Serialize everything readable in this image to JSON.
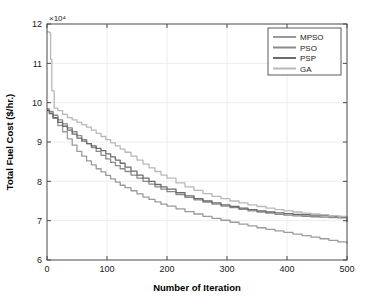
{
  "chart_data": {
    "type": "line",
    "title": "",
    "xlabel": "Number of Iteration",
    "ylabel": "Total Fuel Cost ($/hr.)",
    "y_exponent_label": "×10⁴",
    "y_exponent_value": 10000,
    "xlim": [
      0,
      500
    ],
    "ylim": [
      6,
      12
    ],
    "xticks": [
      0,
      100,
      200,
      300,
      400,
      500
    ],
    "yticks": [
      6,
      7,
      8,
      9,
      10,
      11,
      12
    ],
    "xtick_labels": [
      "0",
      "100",
      "200",
      "300",
      "400",
      "500"
    ],
    "ytick_labels": [
      "6",
      "7",
      "8",
      "9",
      "10",
      "11",
      "12"
    ],
    "grid": true,
    "legend_position": "top-right",
    "colors": {
      "MPSO": "#9a9a9a",
      "PSO": "#8a8a8a",
      "PSP": "#6b6b6b",
      "GA": "#b8b8b8"
    },
    "series": [
      {
        "name": "MPSO",
        "color": "#9a9a9a",
        "x": [
          0,
          4,
          10,
          18,
          26,
          34,
          42,
          50,
          58,
          66,
          74,
          82,
          90,
          98,
          106,
          114,
          122,
          130,
          140,
          150,
          160,
          170,
          180,
          190,
          200,
          215,
          230,
          245,
          260,
          275,
          290,
          305,
          320,
          335,
          350,
          365,
          380,
          395,
          410,
          425,
          440,
          455,
          470,
          485,
          500
        ],
        "y": [
          9.82,
          9.74,
          9.6,
          9.42,
          9.26,
          9.08,
          8.92,
          8.76,
          8.64,
          8.52,
          8.42,
          8.32,
          8.24,
          8.15,
          8.06,
          7.98,
          7.9,
          7.84,
          7.76,
          7.68,
          7.6,
          7.54,
          7.48,
          7.42,
          7.37,
          7.3,
          7.23,
          7.17,
          7.11,
          7.06,
          7.01,
          6.96,
          6.91,
          6.87,
          6.82,
          6.78,
          6.74,
          6.7,
          6.66,
          6.62,
          6.58,
          6.54,
          6.5,
          6.46,
          6.42
        ]
      },
      {
        "name": "PSO",
        "color": "#8a8a8a",
        "x": [
          0,
          4,
          10,
          18,
          26,
          34,
          42,
          50,
          58,
          66,
          74,
          82,
          90,
          98,
          106,
          114,
          122,
          130,
          140,
          150,
          160,
          170,
          180,
          190,
          200,
          215,
          230,
          245,
          260,
          275,
          290,
          305,
          320,
          335,
          350,
          365,
          380,
          395,
          410,
          425,
          440,
          455,
          470,
          485,
          500
        ],
        "y": [
          9.84,
          9.78,
          9.68,
          9.56,
          9.46,
          9.36,
          9.26,
          9.16,
          9.06,
          8.96,
          8.86,
          8.76,
          8.66,
          8.57,
          8.48,
          8.4,
          8.32,
          8.25,
          8.16,
          8.08,
          8.0,
          7.93,
          7.86,
          7.8,
          7.74,
          7.66,
          7.59,
          7.53,
          7.47,
          7.42,
          7.37,
          7.33,
          7.29,
          7.25,
          7.22,
          7.19,
          7.16,
          7.14,
          7.12,
          7.11,
          7.1,
          7.09,
          7.08,
          7.07,
          7.06
        ]
      },
      {
        "name": "PSP",
        "color": "#6b6b6b",
        "x": [
          0,
          4,
          10,
          18,
          26,
          34,
          42,
          50,
          58,
          66,
          74,
          82,
          90,
          98,
          106,
          114,
          122,
          130,
          140,
          150,
          160,
          170,
          180,
          190,
          200,
          215,
          230,
          245,
          260,
          275,
          290,
          305,
          320,
          335,
          350,
          365,
          380,
          395,
          410,
          425,
          440,
          455,
          470,
          480,
          490,
          500
        ],
        "y": [
          9.8,
          9.72,
          9.62,
          9.5,
          9.4,
          9.3,
          9.2,
          9.1,
          9.02,
          8.96,
          8.9,
          8.84,
          8.78,
          8.7,
          8.62,
          8.54,
          8.46,
          8.36,
          8.26,
          8.16,
          8.08,
          8.0,
          7.92,
          7.86,
          7.8,
          7.71,
          7.63,
          7.56,
          7.5,
          7.45,
          7.4,
          7.36,
          7.32,
          7.28,
          7.25,
          7.22,
          7.2,
          7.18,
          7.16,
          7.15,
          7.14,
          7.13,
          7.12,
          7.11,
          7.1,
          6.96
        ]
      },
      {
        "name": "GA",
        "color": "#b8b8b8",
        "x": [
          0,
          2,
          4,
          6,
          8,
          12,
          18,
          26,
          34,
          42,
          50,
          58,
          66,
          74,
          82,
          90,
          98,
          106,
          114,
          122,
          130,
          140,
          150,
          160,
          170,
          180,
          190,
          200,
          215,
          230,
          245,
          260,
          275,
          290,
          305,
          320,
          335,
          350,
          365,
          380,
          395,
          410,
          425,
          440,
          455,
          470,
          485,
          500
        ],
        "y": [
          11.8,
          11.8,
          11.78,
          11.1,
          10.3,
          9.86,
          9.8,
          9.7,
          9.62,
          9.56,
          9.5,
          9.44,
          9.38,
          9.3,
          9.22,
          9.14,
          9.06,
          8.98,
          8.9,
          8.82,
          8.74,
          8.64,
          8.54,
          8.44,
          8.34,
          8.25,
          8.16,
          8.08,
          7.96,
          7.86,
          7.77,
          7.69,
          7.62,
          7.56,
          7.5,
          7.45,
          7.4,
          7.36,
          7.32,
          7.28,
          7.25,
          7.22,
          7.19,
          7.17,
          7.15,
          7.13,
          7.11,
          7.09
        ]
      }
    ],
    "legend_entries": [
      "MPSO",
      "PSO",
      "PSP",
      "GA"
    ]
  },
  "legend": {
    "items": [
      {
        "label": "MPSO"
      },
      {
        "label": "PSO"
      },
      {
        "label": "PSP"
      },
      {
        "label": "GA"
      }
    ]
  },
  "axes": {
    "x_title": "Number of Iteration",
    "y_title": "Total Fuel Cost ($/hr.)",
    "y_exponent": "×10⁴"
  }
}
